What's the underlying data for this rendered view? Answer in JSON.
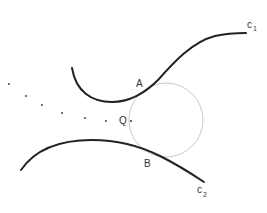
{
  "diagram": {
    "curves": [
      {
        "id": "c1",
        "label": "c",
        "subscript": "1"
      },
      {
        "id": "c2",
        "label": "c",
        "subscript": "2"
      }
    ],
    "points": [
      {
        "id": "A",
        "label": "A"
      },
      {
        "id": "B",
        "label": "B"
      },
      {
        "id": "Q",
        "label": "Q"
      }
    ],
    "circle": {
      "cx": 166,
      "cy": 120,
      "r": 37,
      "color": "#c8c8c8"
    },
    "curve_color": "#222222",
    "dotted_path": [
      [
        9,
        84
      ],
      [
        26,
        96
      ],
      [
        42,
        105
      ],
      [
        62,
        113
      ],
      [
        85,
        118
      ],
      [
        106,
        121
      ],
      [
        131,
        121
      ]
    ]
  }
}
